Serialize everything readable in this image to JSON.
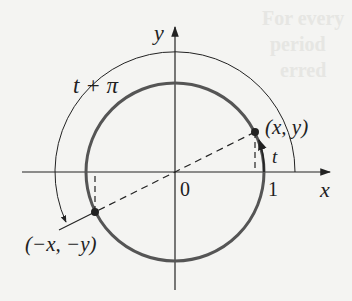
{
  "figure": {
    "type": "unit-circle-diagram",
    "labels": {
      "y_axis": "y",
      "x_axis": "x",
      "origin": "0",
      "one": "1",
      "point_p": "(x, y)",
      "point_q": "(−x, −y)",
      "angle_t": "t",
      "angle_t_pi": "t + π"
    },
    "colors": {
      "background": "#f4f4f2",
      "circle": "#555555",
      "axes": "#222222",
      "ink": "#222222"
    },
    "geometry": {
      "origin_px": [
        175,
        172
      ],
      "circle_radius_px": 89,
      "outer_arc_radius_px": 120,
      "point_p_px": [
        255,
        132
      ],
      "point_q_px": [
        95,
        212
      ]
    }
  },
  "background_ghost_text": [
    "For every",
    "period",
    "erred"
  ]
}
